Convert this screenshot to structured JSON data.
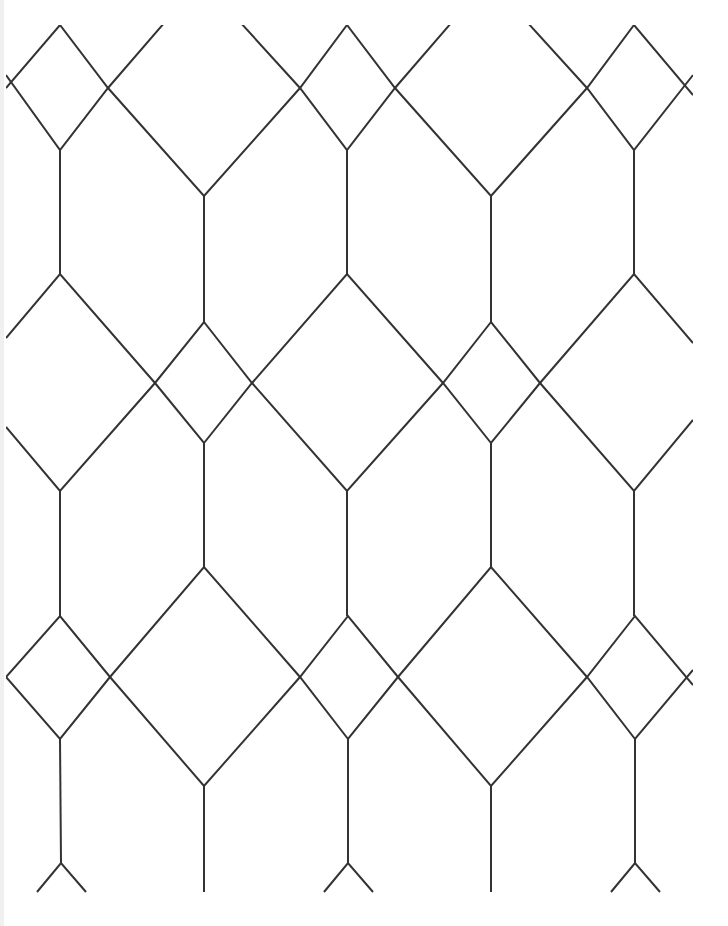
{
  "image": {
    "description": "Geometric line-art lattice pattern of diamonds and hexagonal cells on white background",
    "background": "#ffffff",
    "stroke_color": "#333333",
    "stroke_width": 2,
    "clip": {
      "x": 6,
      "y": 25,
      "width": 687,
      "height": 868
    }
  },
  "pattern": {
    "columns_a": [
      60,
      347,
      634
    ],
    "columns_b": [
      204,
      491
    ],
    "polylines": [
      [
        [
          6,
          88
        ],
        [
          60,
          25
        ],
        [
          108,
          88
        ],
        [
          204,
          196
        ],
        [
          300,
          88
        ],
        [
          347,
          25
        ],
        [
          395,
          88
        ],
        [
          491,
          196
        ],
        [
          587,
          88
        ],
        [
          634,
          25
        ],
        [
          693,
          95
        ]
      ],
      [
        [
          6,
          75
        ],
        [
          60,
          150
        ],
        [
          108,
          88
        ],
        [
          165,
          22
        ]
      ],
      [
        [
          240,
          22
        ],
        [
          300,
          88
        ],
        [
          347,
          150
        ],
        [
          395,
          88
        ],
        [
          452,
          22
        ]
      ],
      [
        [
          527,
          22
        ],
        [
          587,
          88
        ],
        [
          634,
          150
        ],
        [
          693,
          75
        ]
      ],
      [
        [
          60,
          150
        ],
        [
          60,
          274
        ]
      ],
      [
        [
          347,
          150
        ],
        [
          347,
          274
        ]
      ],
      [
        [
          634,
          150
        ],
        [
          634,
          274
        ]
      ],
      [
        [
          204,
          196
        ],
        [
          204,
          322
        ]
      ],
      [
        [
          491,
          196
        ],
        [
          491,
          322
        ]
      ],
      [
        [
          6,
          338
        ],
        [
          60,
          274
        ],
        [
          155,
          383
        ],
        [
          204,
          443
        ],
        [
          252,
          383
        ],
        [
          347,
          274
        ],
        [
          443,
          383
        ],
        [
          491,
          443
        ],
        [
          540,
          383
        ],
        [
          634,
          274
        ],
        [
          693,
          343
        ]
      ],
      [
        [
          6,
          427
        ],
        [
          60,
          491
        ],
        [
          155,
          383
        ],
        [
          204,
          322
        ],
        [
          252,
          383
        ],
        [
          347,
          491
        ],
        [
          443,
          383
        ],
        [
          491,
          322
        ],
        [
          540,
          383
        ],
        [
          634,
          491
        ],
        [
          693,
          420
        ]
      ],
      [
        [
          60,
          491
        ],
        [
          60,
          616
        ]
      ],
      [
        [
          347,
          491
        ],
        [
          347,
          616
        ]
      ],
      [
        [
          634,
          491
        ],
        [
          634,
          616
        ]
      ],
      [
        [
          204,
          443
        ],
        [
          204,
          567
        ]
      ],
      [
        [
          491,
          443
        ],
        [
          491,
          567
        ]
      ],
      [
        [
          6,
          677
        ],
        [
          60,
          616
        ],
        [
          110,
          677
        ],
        [
          204,
          786
        ],
        [
          300,
          677
        ],
        [
          348,
          616
        ],
        [
          398,
          677
        ],
        [
          491,
          786
        ],
        [
          587,
          677
        ],
        [
          635,
          616
        ],
        [
          693,
          685
        ]
      ],
      [
        [
          6,
          677
        ],
        [
          60,
          739
        ],
        [
          110,
          677
        ],
        [
          204,
          567
        ],
        [
          300,
          677
        ],
        [
          348,
          739
        ],
        [
          398,
          677
        ],
        [
          491,
          567
        ],
        [
          587,
          677
        ],
        [
          635,
          739
        ],
        [
          693,
          670
        ]
      ],
      [
        [
          60,
          739
        ],
        [
          61,
          863
        ]
      ],
      [
        [
          348,
          739
        ],
        [
          348,
          863
        ]
      ],
      [
        [
          635,
          739
        ],
        [
          635,
          863
        ]
      ],
      [
        [
          204,
          786
        ],
        [
          204,
          892
        ]
      ],
      [
        [
          491,
          786
        ],
        [
          491,
          892
        ]
      ],
      [
        [
          37,
          892
        ],
        [
          61,
          863
        ],
        [
          86,
          892
        ]
      ],
      [
        [
          324,
          892
        ],
        [
          348,
          863
        ],
        [
          373,
          892
        ]
      ],
      [
        [
          611,
          892
        ],
        [
          635,
          863
        ],
        [
          660,
          892
        ]
      ]
    ]
  }
}
